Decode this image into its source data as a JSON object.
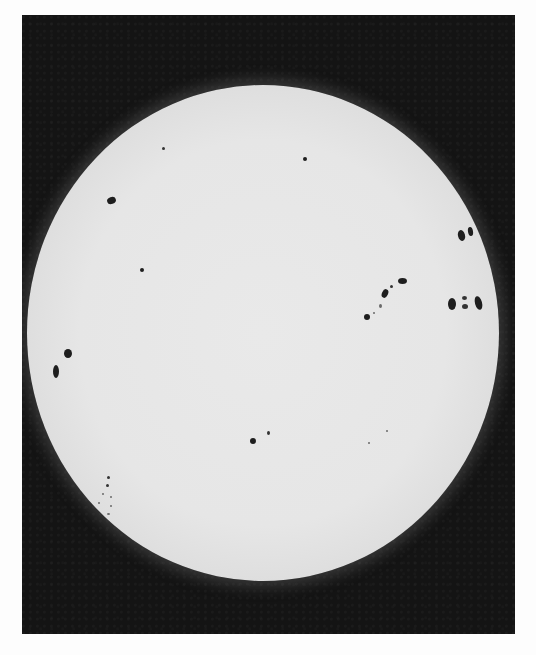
{
  "image": {
    "subject": "Photograph of the solar disc with sunspots",
    "style": "grayscale",
    "colors": {
      "page_background": "#fdfdfd",
      "frame_background": "#141414",
      "disc_center": "#e8e8e8",
      "disc_limb": "#8f8f8f",
      "sunspot": "#1e1e1e"
    },
    "sunspot_groups": [
      {
        "name": "upper-left-spot",
        "x": 111,
        "y": 201
      },
      {
        "name": "upper-left-small",
        "x": 163,
        "y": 148
      },
      {
        "name": "upper-center-small",
        "x": 305,
        "y": 158
      },
      {
        "name": "left-mid-small",
        "x": 142,
        "y": 270
      },
      {
        "name": "right-edge-pair",
        "x": 465,
        "y": 233
      },
      {
        "name": "right-edge-group",
        "x": 465,
        "y": 303
      },
      {
        "name": "center-right-chain",
        "x": 383,
        "y": 297
      },
      {
        "name": "left-limb-pair",
        "x": 60,
        "y": 365
      },
      {
        "name": "lower-left-cluster",
        "x": 105,
        "y": 485
      },
      {
        "name": "lower-center-spot",
        "x": 253,
        "y": 440
      },
      {
        "name": "lower-right-faint",
        "x": 375,
        "y": 442
      }
    ]
  }
}
